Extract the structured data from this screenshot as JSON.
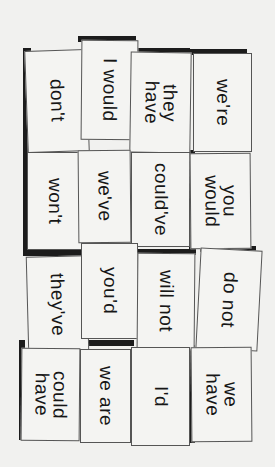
{
  "cards": [
    {
      "text": "don't",
      "x": 26,
      "y": 50,
      "w": 62,
      "h": 102,
      "rot": -2.0,
      "sx": 23,
      "sy": 48,
      "sw": 8,
      "sh": 104
    },
    {
      "text": "I would",
      "x": 81,
      "y": 40,
      "w": 57,
      "h": 100,
      "rot": 0.5,
      "sx": 78,
      "sy": 36,
      "sw": 58,
      "sh": 6
    },
    {
      "text": "they\nhave",
      "x": 130,
      "y": 52,
      "w": 61,
      "h": 101,
      "rot": 0.8,
      "sx": 138,
      "sy": 48,
      "sw": 52,
      "sh": 6
    },
    {
      "text": "we're",
      "x": 193,
      "y": 53,
      "w": 59,
      "h": 99,
      "rot": 0.0,
      "sx": 189,
      "sy": 49,
      "sw": 58,
      "sh": 6
    },
    {
      "text": "won't",
      "x": 27,
      "y": 152,
      "w": 56,
      "h": 98,
      "rot": 0.0,
      "sx": 23,
      "sy": 148,
      "sw": 6,
      "sh": 102
    },
    {
      "text": "we've",
      "x": 78,
      "y": 150,
      "w": 53,
      "h": 93,
      "rot": -0.5,
      "sx": 0,
      "sy": 0,
      "sw": 0,
      "sh": 0
    },
    {
      "text": "could've",
      "x": 131,
      "y": 152,
      "w": 59,
      "h": 95,
      "rot": 0.0,
      "sx": 0,
      "sy": 0,
      "sw": 0,
      "sh": 0
    },
    {
      "text": "you\nwould",
      "x": 190,
      "y": 153,
      "w": 61,
      "h": 96,
      "rot": -0.5,
      "sx": 189,
      "sy": 150,
      "sw": 6,
      "sh": 100
    },
    {
      "text": "they've",
      "x": 27,
      "y": 256,
      "w": 61,
      "h": 97,
      "rot": -1.5,
      "sx": 23,
      "sy": 250,
      "sw": 60,
      "sh": 6
    },
    {
      "text": "you'd",
      "x": 81,
      "y": 243,
      "w": 57,
      "h": 96,
      "rot": 0.0,
      "sx": 0,
      "sy": 0,
      "sw": 0,
      "sh": 0
    },
    {
      "text": "will not",
      "x": 137,
      "y": 253,
      "w": 58,
      "h": 97,
      "rot": 0.5,
      "sx": 138,
      "sy": 249,
      "sw": 58,
      "sh": 6
    },
    {
      "text": "do not",
      "x": 198,
      "y": 249,
      "w": 62,
      "h": 101,
      "rot": 3.0,
      "sx": 200,
      "sy": 246,
      "sw": 56,
      "sh": 6
    },
    {
      "text": "could\nhave",
      "x": 21,
      "y": 348,
      "w": 59,
      "h": 93,
      "rot": 0.5,
      "sx": 19,
      "sy": 340,
      "sw": 6,
      "sh": 100
    },
    {
      "text": "we are",
      "x": 80,
      "y": 349,
      "w": 51,
      "h": 94,
      "rot": 0.0,
      "sx": 82,
      "sy": 340,
      "sw": 52,
      "sh": 6
    },
    {
      "text": "I'd",
      "x": 131,
      "y": 347,
      "w": 59,
      "h": 99,
      "rot": 0.0,
      "sx": 0,
      "sy": 0,
      "sw": 0,
      "sh": 0
    },
    {
      "text": "we\nhave",
      "x": 191,
      "y": 347,
      "w": 61,
      "h": 95,
      "rot": -0.5,
      "sx": 189,
      "sy": 345,
      "sw": 6,
      "sh": 98
    }
  ]
}
